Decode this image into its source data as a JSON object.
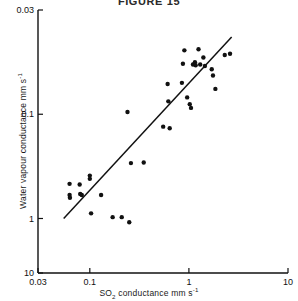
{
  "figure": {
    "title": "FIGURE 15",
    "background_color": "#ffffff",
    "ink_color": "#111111"
  },
  "axes": {
    "x_label_prefix": "SO",
    "x_label_sub": "2",
    "x_label_suffix": " conductance mm s",
    "x_label_sup": "-1",
    "y_label_prefix": "Water vapour conductance mm s",
    "y_label_sup": "-1",
    "x_ticks": [
      "0.03",
      "0.1",
      "1",
      "10"
    ],
    "y_ticks": [
      "10",
      "1",
      "0.1",
      "0.03"
    ]
  },
  "chart_data": {
    "type": "scatter",
    "title": "FIGURE 15",
    "xlabel": "SO2 conductance mm s-1",
    "ylabel": "Water vapour conductance mm s-1",
    "xscale": "log",
    "yscale": "log",
    "xlim": [
      0.03,
      10
    ],
    "ylim": [
      0.03,
      10
    ],
    "xticks": [
      0.03,
      0.1,
      1,
      10
    ],
    "yticks": [
      0.03,
      0.1,
      1,
      10
    ],
    "grid": false,
    "legend": null,
    "marker": "filled-circle",
    "marker_color": "#111111",
    "points": [
      [
        0.0625,
        0.215
      ],
      [
        0.0625,
        0.168
      ],
      [
        0.063,
        0.158
      ],
      [
        0.079,
        0.212
      ],
      [
        0.08,
        0.172
      ],
      [
        0.083,
        0.168
      ],
      [
        0.1,
        0.258
      ],
      [
        0.1,
        0.24
      ],
      [
        0.103,
        0.112
      ],
      [
        0.13,
        0.168
      ],
      [
        0.17,
        0.103
      ],
      [
        0.21,
        0.103
      ],
      [
        0.25,
        0.092
      ],
      [
        0.26,
        0.34
      ],
      [
        0.24,
        1.05
      ],
      [
        0.35,
        0.345
      ],
      [
        0.55,
        0.76
      ],
      [
        0.64,
        0.735
      ],
      [
        0.62,
        1.33
      ],
      [
        0.61,
        1.95
      ],
      [
        0.85,
        2.0
      ],
      [
        0.87,
        3.05
      ],
      [
        0.9,
        4.1
      ],
      [
        0.96,
        1.45
      ],
      [
        1.02,
        1.25
      ],
      [
        1.05,
        1.15
      ],
      [
        1.1,
        3.0
      ],
      [
        1.15,
        3.15
      ],
      [
        1.17,
        2.95
      ],
      [
        1.25,
        4.2
      ],
      [
        1.3,
        3.0
      ],
      [
        1.4,
        3.5
      ],
      [
        1.45,
        2.9
      ],
      [
        1.7,
        2.7
      ],
      [
        1.75,
        2.35
      ],
      [
        1.85,
        1.75
      ],
      [
        2.3,
        3.7
      ],
      [
        2.6,
        3.8
      ]
    ],
    "fit_line": {
      "type": "linear-on-log",
      "x_start": 0.0545,
      "y_start": 0.1,
      "x_end": 2.7,
      "y_end": 5.5
    }
  }
}
